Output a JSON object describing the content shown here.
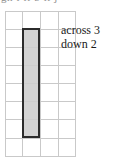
{
  "figure": {
    "type": "grid-diagram",
    "clipped_header_text": "gh  i   ll  b   ll   j",
    "grid": {
      "columns": 4,
      "rows": 8,
      "cell_size_px": 18,
      "line_color": "#c9c9c9"
    },
    "rectangle": {
      "fill_color": "#cdcdcd",
      "border_color": "#2b2b2b",
      "cells_across": 1,
      "cells_down": 6
    },
    "labels": [
      {
        "text": "across 3"
      },
      {
        "text": "down 2"
      }
    ]
  }
}
